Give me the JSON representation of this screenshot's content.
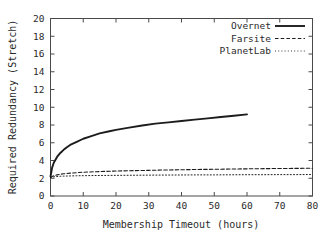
{
  "chart_data": {
    "type": "line",
    "title": "",
    "xlabel": "Membership Timeout (hours)",
    "ylabel": "Required Redundancy (Stretch)",
    "xlim": [
      0,
      80
    ],
    "ylim": [
      0,
      20
    ],
    "xticks": [
      0,
      10,
      20,
      30,
      40,
      50,
      60,
      70,
      80
    ],
    "yticks": [
      0,
      2,
      4,
      6,
      8,
      10,
      12,
      14,
      16,
      18,
      20
    ],
    "xtick_labels": [
      "0",
      "10",
      "20",
      "30",
      "40",
      "50",
      "60",
      "70",
      "80"
    ],
    "ytick_labels": [
      "0",
      "2",
      "4",
      "6",
      "8",
      "10",
      "12",
      "14",
      "16",
      "18",
      "20"
    ],
    "grid": false,
    "legend_position": "top-right",
    "series": [
      {
        "name": "Overnet",
        "style": "solid",
        "color": "#1c1c1c",
        "width": 1.9,
        "x": [
          0,
          0.5,
          1,
          2,
          3,
          4,
          5,
          6,
          8,
          10,
          12,
          15,
          18,
          20,
          24,
          28,
          32,
          36,
          40,
          44,
          48,
          52,
          56,
          60
        ],
        "values": [
          2.2,
          3.2,
          3.75,
          4.4,
          4.85,
          5.2,
          5.5,
          5.75,
          6.1,
          6.45,
          6.7,
          7.05,
          7.3,
          7.45,
          7.7,
          7.95,
          8.15,
          8.3,
          8.45,
          8.6,
          8.75,
          8.9,
          9.05,
          9.2
        ]
      },
      {
        "name": "Farsite",
        "style": "dashed",
        "color": "#1c1c1c",
        "width": 1.1,
        "x": [
          0,
          0.5,
          1,
          2,
          3,
          4,
          5,
          6,
          8,
          10,
          14,
          18,
          22,
          26,
          30,
          35,
          40,
          45,
          50,
          55,
          60,
          65,
          70,
          75,
          80
        ],
        "values": [
          2.1,
          2.2,
          2.28,
          2.38,
          2.45,
          2.5,
          2.54,
          2.58,
          2.63,
          2.68,
          2.74,
          2.79,
          2.83,
          2.86,
          2.89,
          2.93,
          2.96,
          2.99,
          3.01,
          3.04,
          3.06,
          3.08,
          3.1,
          3.11,
          3.13
        ]
      },
      {
        "name": "PlanetLab",
        "style": "dotted",
        "color": "#3a3a3a",
        "width": 1.0,
        "x": [
          0,
          0.5,
          1,
          2,
          3,
          4,
          6,
          8,
          10,
          14,
          18,
          22,
          26,
          30,
          35,
          40,
          45,
          50,
          55,
          60,
          65,
          70,
          75,
          80
        ],
        "values": [
          2.05,
          2.12,
          2.16,
          2.2,
          2.22,
          2.24,
          2.26,
          2.28,
          2.29,
          2.31,
          2.32,
          2.33,
          2.34,
          2.35,
          2.36,
          2.37,
          2.38,
          2.38,
          2.39,
          2.4,
          2.4,
          2.41,
          2.41,
          2.42
        ]
      }
    ]
  },
  "legend": {
    "entries": [
      {
        "label": "Overnet"
      },
      {
        "label": "Farsite"
      },
      {
        "label": "PlanetLab"
      }
    ]
  },
  "axes": {
    "x_title": "Membership Timeout (hours)",
    "y_title": "Required Redundancy (Stretch)"
  }
}
